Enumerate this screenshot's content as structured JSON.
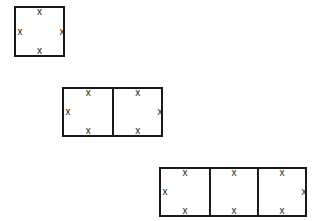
{
  "diagram": {
    "marker": "x",
    "groups": [
      {
        "name": "single-square",
        "cells": 1,
        "x": 14,
        "y": 6,
        "height": 51
      },
      {
        "name": "two-squares",
        "cells": 2,
        "x": 62,
        "y": 87,
        "height": 50
      },
      {
        "name": "three-squares",
        "cells": 3,
        "x": 159,
        "y": 167,
        "height": 50
      }
    ]
  }
}
